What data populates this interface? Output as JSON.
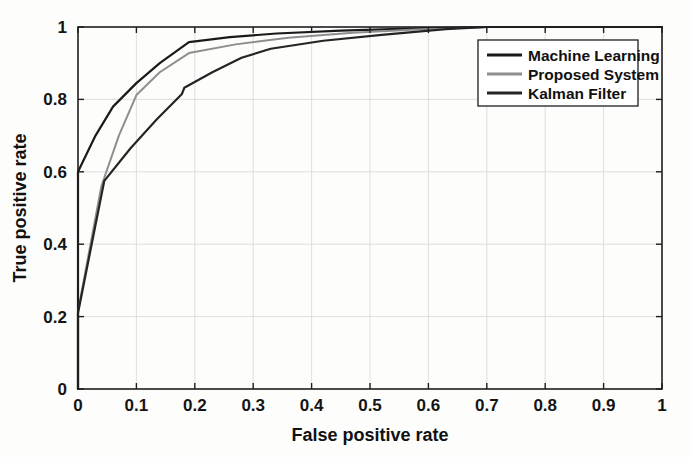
{
  "figure": {
    "background_color": "#fdfdfc",
    "frame_color": "#1e1e1e",
    "grid_color": "#d8d8d8"
  },
  "chart_data": {
    "type": "line",
    "title": "",
    "xlabel": "False positive rate",
    "ylabel": "True positive rate",
    "xlim": [
      0,
      1
    ],
    "ylim": [
      0,
      1
    ],
    "grid": true,
    "legend_position": "upper right",
    "xticks": [
      "0",
      "0.1",
      "0.2",
      "0.3",
      "0.4",
      "0.5",
      "0.6",
      "0.7",
      "0.8",
      "0.9",
      "1"
    ],
    "xtick_values": [
      0,
      0.1,
      0.2,
      0.3,
      0.4,
      0.5,
      0.6,
      0.7,
      0.8,
      0.9,
      1
    ],
    "yticks": [
      "0",
      "0.2",
      "0.4",
      "0.6",
      "0.8",
      "1"
    ],
    "ytick_values": [
      0,
      0.2,
      0.4,
      0.6,
      0.8,
      1
    ],
    "series": [
      {
        "name": "Machine Learning",
        "color": "#1a1a1a",
        "width": 2.2,
        "x": [
          0,
          0,
          0.03,
          0.06,
          0.1,
          0.14,
          0.19,
          0.26,
          0.34,
          0.45,
          0.58,
          0.7,
          1.0
        ],
        "y": [
          0,
          0.6,
          0.7,
          0.78,
          0.845,
          0.9,
          0.958,
          0.972,
          0.982,
          0.99,
          0.996,
          1.0,
          1.0
        ]
      },
      {
        "name": "Proposed System",
        "color": "#8e8e8e",
        "width": 2.0,
        "x": [
          0,
          0,
          0.04,
          0.07,
          0.1,
          0.14,
          0.19,
          0.27,
          0.36,
          0.47,
          0.58,
          0.7,
          1.0
        ],
        "y": [
          0,
          0.215,
          0.56,
          0.7,
          0.812,
          0.875,
          0.928,
          0.952,
          0.97,
          0.984,
          0.993,
          1.0,
          1.0
        ]
      },
      {
        "name": "Kalman Filter",
        "color": "#242424",
        "width": 2.2,
        "x": [
          0,
          0,
          0.045,
          0.09,
          0.135,
          0.178,
          0.182,
          0.23,
          0.28,
          0.33,
          0.42,
          0.52,
          0.63,
          0.7,
          1.0
        ],
        "y": [
          0,
          0.21,
          0.575,
          0.665,
          0.745,
          0.815,
          0.832,
          0.875,
          0.915,
          0.94,
          0.962,
          0.978,
          0.994,
          1.0,
          1.0
        ]
      }
    ]
  },
  "legend": {
    "entries": [
      {
        "label": "Machine Learning",
        "color": "#1a1a1a"
      },
      {
        "label": "Proposed System",
        "color": "#8e8e8e"
      },
      {
        "label": "Kalman Filter",
        "color": "#242424"
      }
    ]
  }
}
